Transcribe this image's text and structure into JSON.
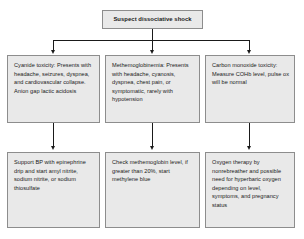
{
  "diagram": {
    "title": "Suspect dissociative shock",
    "type": "flowchart",
    "root": {
      "label": "Suspect dissociative shock"
    },
    "branches": [
      {
        "id": "cyanide",
        "diagnosis": "Cyanide toxicity: Presents with headache, seizures, dyspnea, and cardiovascular collapse. Anion gap lactic acidosis",
        "treatment": "Support BP with epinephrine drip and start amyl nitrite, sodium nitrite, or sodium thiosulfate"
      },
      {
        "id": "methemoglobinemia",
        "diagnosis": "Methemoglobinemia: Presents with headache, cyanosis, dyspnea, chest pain, or symptomatic, rarely with hypotension",
        "treatment": "Check methemoglobin level, if greater than 20%, start methylene blue"
      },
      {
        "id": "carbon-monoxide",
        "diagnosis": "Carbon monoxide toxicity: Measure COHb level, pulse ox will be normal",
        "treatment": "Oxygen therapy by nonrebreather and possible need for hyperbaric oxygen depending on level, symptoms, and pregnancy status"
      }
    ],
    "colors": {
      "box_fill": "#e9e9e9",
      "box_border": "#8d8d8d",
      "connector": "#1a1a1a",
      "text": "#1a1a1a",
      "background": "#ffffff"
    }
  }
}
